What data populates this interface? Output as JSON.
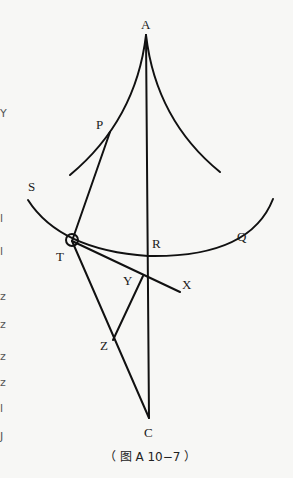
{
  "figure": {
    "caption": "（ 图 A 10−7 ）",
    "points": {
      "A": "A",
      "P": "P",
      "S": "S",
      "T": "T",
      "R": "R",
      "Q": "Q",
      "Y": "Y",
      "X": "X",
      "Z": "Z",
      "C": "C"
    },
    "left_margin_fragments": [
      "Y",
      "",
      "l",
      "l",
      "",
      "z",
      "z",
      "",
      "z",
      "z",
      "l",
      "J"
    ]
  }
}
